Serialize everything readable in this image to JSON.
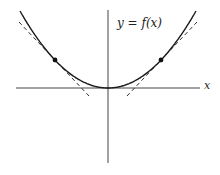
{
  "diagram": {
    "title": "",
    "function_label": "y = f(x)",
    "x_axis_label": "x",
    "colors": {
      "curve": "#1a1a1a",
      "axes": "#444444",
      "tangent": "#333333",
      "point": "#111111",
      "background": "#ffffff"
    },
    "axes": {
      "origin": [
        108,
        88
      ],
      "x_axis": {
        "x1": 16,
        "x2": 200,
        "y": 88
      },
      "y_axis": {
        "x": 108,
        "y1": 10,
        "y2": 163
      }
    },
    "curve": {
      "type": "parabola",
      "vertex": [
        108,
        88
      ],
      "k": 0.00994,
      "x_range": [
        20,
        196
      ]
    },
    "points": [
      {
        "name": "left-point",
        "x": 55,
        "y": 60
      },
      {
        "name": "right-point",
        "x": 161,
        "y": 60
      }
    ],
    "tangents": [
      {
        "name": "left-tangent",
        "x1": 19,
        "y1": 22,
        "x2": 89,
        "y2": 96
      },
      {
        "name": "right-tangent",
        "x1": 127,
        "y1": 96,
        "x2": 197,
        "y2": 22
      }
    ]
  }
}
